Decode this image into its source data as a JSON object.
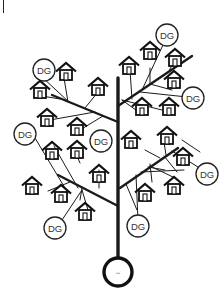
{
  "diagram": {
    "type": "microgrid-tree",
    "corner_mark": "|",
    "generator": {
      "label": "~",
      "cx": 118,
      "cy": 272,
      "r": 14
    },
    "trunk": {
      "x": 118,
      "y1": 78,
      "y2": 258
    },
    "branches": [
      {
        "x1": 118,
        "y1": 122,
        "x2": 52,
        "y2": 95
      },
      {
        "x1": 118,
        "y1": 106,
        "x2": 192,
        "y2": 56
      },
      {
        "x1": 118,
        "y1": 206,
        "x2": 58,
        "y2": 175
      },
      {
        "x1": 120,
        "y1": 188,
        "x2": 178,
        "y2": 148
      }
    ],
    "feeders": [
      {
        "x1": 70,
        "y1": 103,
        "x2": 42,
        "y2": 77
      },
      {
        "x1": 68,
        "y1": 102,
        "x2": 64,
        "y2": 78
      },
      {
        "x1": 60,
        "y1": 99,
        "x2": 42,
        "y2": 96
      },
      {
        "x1": 85,
        "y1": 108,
        "x2": 98,
        "y2": 92
      },
      {
        "x1": 95,
        "y1": 112,
        "x2": 50,
        "y2": 120
      },
      {
        "x1": 103,
        "y1": 116,
        "x2": 80,
        "y2": 130
      },
      {
        "x1": 142,
        "y1": 90,
        "x2": 163,
        "y2": 45
      },
      {
        "x1": 150,
        "y1": 84,
        "x2": 150,
        "y2": 68
      },
      {
        "x1": 168,
        "y1": 73,
        "x2": 172,
        "y2": 65
      },
      {
        "x1": 132,
        "y1": 99,
        "x2": 130,
        "y2": 70
      },
      {
        "x1": 150,
        "y1": 84,
        "x2": 172,
        "y2": 90
      },
      {
        "x1": 140,
        "y1": 92,
        "x2": 187,
        "y2": 97
      },
      {
        "x1": 122,
        "y1": 100,
        "x2": 162,
        "y2": 110
      },
      {
        "x1": 122,
        "y1": 100,
        "x2": 140,
        "y2": 113
      },
      {
        "x1": 35,
        "y1": 138,
        "x2": 68,
        "y2": 193
      },
      {
        "x1": 54,
        "y1": 146,
        "x2": 78,
        "y2": 188
      },
      {
        "x1": 77,
        "y1": 156,
        "x2": 80,
        "y2": 163
      },
      {
        "x1": 99,
        "y1": 188,
        "x2": 99,
        "y2": 170
      },
      {
        "x1": 70,
        "y1": 182,
        "x2": 48,
        "y2": 191
      },
      {
        "x1": 82,
        "y1": 188,
        "x2": 80,
        "y2": 200
      },
      {
        "x1": 82,
        "y1": 190,
        "x2": 62,
        "y2": 220
      },
      {
        "x1": 82,
        "y1": 190,
        "x2": 88,
        "y2": 210
      },
      {
        "x1": 126,
        "y1": 184,
        "x2": 137,
        "y2": 210
      },
      {
        "x1": 148,
        "y1": 167,
        "x2": 165,
        "y2": 170
      },
      {
        "x1": 141,
        "y1": 172,
        "x2": 184,
        "y2": 170
      },
      {
        "x1": 150,
        "y1": 164,
        "x2": 152,
        "y2": 182
      },
      {
        "x1": 136,
        "y1": 175,
        "x2": 138,
        "y2": 220
      },
      {
        "x1": 150,
        "y1": 166,
        "x2": 175,
        "y2": 178
      },
      {
        "x1": 166,
        "y1": 155,
        "x2": 164,
        "y2": 142
      },
      {
        "x1": 160,
        "y1": 158,
        "x2": 145,
        "y2": 150
      },
      {
        "x1": 164,
        "y1": 156,
        "x2": 177,
        "y2": 172
      },
      {
        "x1": 172,
        "y1": 151,
        "x2": 198,
        "y2": 167
      },
      {
        "x1": 182,
        "y1": 140,
        "x2": 200,
        "y2": 152
      }
    ],
    "dg_units": [
      {
        "label": "DG",
        "cx": 44,
        "cy": 70,
        "r": 11
      },
      {
        "label": "DG",
        "cx": 167,
        "cy": 35,
        "r": 11
      },
      {
        "label": "DG",
        "cx": 193,
        "cy": 98,
        "r": 11
      },
      {
        "label": "DG",
        "cx": 25,
        "cy": 134,
        "r": 11
      },
      {
        "label": "DG",
        "cx": 101,
        "cy": 141,
        "r": 11
      },
      {
        "label": "DG",
        "cx": 207,
        "cy": 174,
        "r": 11
      },
      {
        "label": "DG",
        "cx": 55,
        "cy": 228,
        "r": 11
      },
      {
        "label": "DG",
        "cx": 138,
        "cy": 226,
        "r": 11
      }
    ],
    "houses": [
      {
        "x": 66,
        "y": 72
      },
      {
        "x": 40,
        "y": 90
      },
      {
        "x": 98,
        "y": 87
      },
      {
        "x": 47,
        "y": 118
      },
      {
        "x": 77,
        "y": 127
      },
      {
        "x": 52,
        "y": 151
      },
      {
        "x": 77,
        "y": 150
      },
      {
        "x": 32,
        "y": 186
      },
      {
        "x": 61,
        "y": 194
      },
      {
        "x": 85,
        "y": 212
      },
      {
        "x": 99,
        "y": 174
      },
      {
        "x": 129,
        "y": 66
      },
      {
        "x": 150,
        "y": 51
      },
      {
        "x": 175,
        "y": 58
      },
      {
        "x": 174,
        "y": 80
      },
      {
        "x": 142,
        "y": 107
      },
      {
        "x": 169,
        "y": 107
      },
      {
        "x": 131,
        "y": 140
      },
      {
        "x": 167,
        "y": 136
      },
      {
        "x": 183,
        "y": 157
      },
      {
        "x": 174,
        "y": 186
      },
      {
        "x": 145,
        "y": 193
      }
    ]
  }
}
